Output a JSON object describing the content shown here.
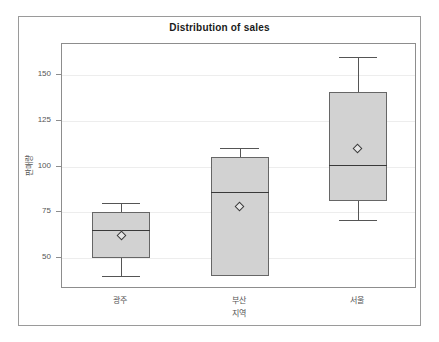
{
  "chart_data": {
    "type": "box",
    "title": "Distribution of sales",
    "xlabel": "지역",
    "ylabel": "판매량",
    "categories": [
      "광주",
      "부산",
      "서울"
    ],
    "ytick_labels": [
      "50",
      "75",
      "100",
      "125",
      "150"
    ],
    "yticks": [
      50,
      75,
      100,
      125,
      150
    ],
    "ylim": [
      33,
      167
    ],
    "grid": true,
    "legend": "none",
    "boxes": [
      {
        "category": "광주",
        "whisker_low": 40,
        "q1": 50,
        "median": 65,
        "q3": 75,
        "whisker_high": 80,
        "mean": 62
      },
      {
        "category": "부산",
        "whisker_low": 40,
        "q1": 40,
        "median": 86,
        "q3": 105,
        "whisker_high": 110,
        "mean": 78
      },
      {
        "category": "서울",
        "whisker_low": 71,
        "q1": 81,
        "median": 101,
        "q3": 141,
        "whisker_high": 160,
        "mean": 110
      }
    ],
    "colors": {
      "box_fill": "#d2d2d2",
      "box_border": "#666666",
      "median": "#3a3a3a",
      "whisker": "#555555",
      "grid": "#ededed",
      "frame": "#8d8d8d",
      "text": "#555555",
      "title": "#1a1a1a",
      "background": "#ffffff"
    }
  }
}
